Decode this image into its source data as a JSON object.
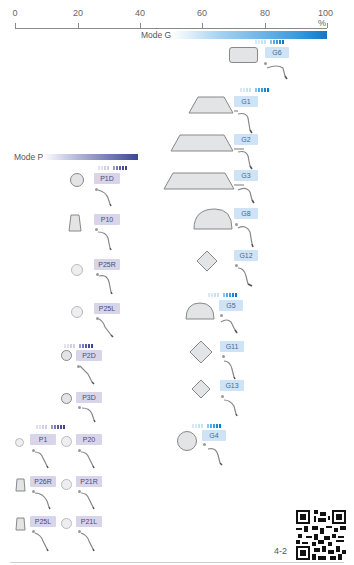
{
  "scale": {
    "ticks": [
      {
        "label": "0",
        "x": 15
      },
      {
        "label": "20",
        "x": 78
      },
      {
        "label": "40",
        "x": 140
      },
      {
        "label": "60",
        "x": 202
      },
      {
        "label": "80",
        "x": 265
      },
      {
        "label": "100 %",
        "x": 327
      }
    ],
    "unit": "%"
  },
  "mode_g": {
    "label": "Mode G",
    "color_start": "#ffffff",
    "color_end": "#1177cc"
  },
  "mode_p": {
    "label": "Mode P",
    "color_start": "#ffffff",
    "color_end": "#3d4691"
  },
  "tips_g": [
    {
      "label": "G6",
      "shape": "rounded-rect"
    },
    {
      "label": "G1",
      "shape": "trapezoid"
    },
    {
      "label": "G2",
      "shape": "trapezoid-wide"
    },
    {
      "label": "G3",
      "shape": "trapezoid-wide"
    },
    {
      "label": "G8",
      "shape": "half-circle"
    },
    {
      "label": "G12",
      "shape": "diamond"
    },
    {
      "label": "G5",
      "shape": "half-circle"
    },
    {
      "label": "G11",
      "shape": "diamond"
    },
    {
      "label": "G13",
      "shape": "diamond"
    },
    {
      "label": "G4",
      "shape": "circle"
    }
  ],
  "tips_p": [
    {
      "label": "P1D",
      "shape": "circle"
    },
    {
      "label": "P10",
      "shape": "trapezoid-tall"
    },
    {
      "label": "P25R",
      "shape": "circle-small"
    },
    {
      "label": "P25L",
      "shape": "circle-small"
    },
    {
      "label": "P2D",
      "shape": "circle-small"
    },
    {
      "label": "P3D",
      "shape": "circle-small"
    },
    {
      "label": "P1",
      "shape": "circle-tiny"
    },
    {
      "label": "P20",
      "shape": "circle-small"
    },
    {
      "label": "P26R",
      "shape": "trapezoid-tall"
    },
    {
      "label": "P21R",
      "shape": "circle-small"
    },
    {
      "label": "P25L",
      "shape": "trapezoid-tall"
    },
    {
      "label": "P21L",
      "shape": "circle-small"
    }
  ],
  "footer": {
    "page_number": "4-2",
    "qr_code": "qr-code"
  }
}
